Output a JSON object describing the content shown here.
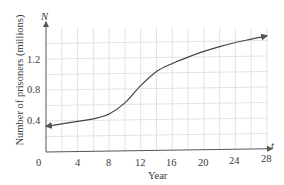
{
  "chart_data": {
    "type": "line",
    "title": "",
    "xlabel": "Year",
    "ylabel": "Number of prisoners (millions)",
    "x_axis_symbol": "t",
    "y_axis_symbol": "N",
    "xlim": [
      0,
      28
    ],
    "ylim": [
      0,
      1.6
    ],
    "x_ticks": [
      0,
      4,
      8,
      12,
      16,
      20,
      24,
      28
    ],
    "x_tick_labels": [
      "0",
      "4",
      "8",
      "12",
      "16",
      "20",
      "24",
      "28"
    ],
    "y_ticks": [
      0.4,
      0.8,
      1.2
    ],
    "y_tick_labels": [
      "0.4",
      "0.8",
      "1.2"
    ],
    "grid": true,
    "x_grid_step": 2,
    "y_grid_step": 0.2,
    "series": [
      {
        "name": "N(t)",
        "x": [
          0,
          2,
          4,
          6,
          8,
          10,
          12,
          14,
          16,
          18,
          20,
          22,
          24,
          26,
          28
        ],
        "values": [
          0.33,
          0.36,
          0.39,
          0.42,
          0.48,
          0.62,
          0.84,
          1.02,
          1.12,
          1.2,
          1.27,
          1.33,
          1.38,
          1.42,
          1.46
        ]
      }
    ],
    "annotations": [
      "arrowheads at both ends of the curve"
    ]
  },
  "labels": {
    "y_symbol": "N",
    "x_symbol": "t",
    "xlabel": "Year",
    "ylabel": "Number of prisoners (millions)",
    "y0": "0.4",
    "y1": "0.8",
    "y2": "1.2",
    "x0": "0",
    "x1": "4",
    "x2": "8",
    "x3": "12",
    "x4": "16",
    "x5": "20",
    "x6": "24",
    "x7": "28"
  },
  "colors": {
    "grid": "#dcdcdc",
    "axis": "#555555",
    "curve": "#444444"
  }
}
